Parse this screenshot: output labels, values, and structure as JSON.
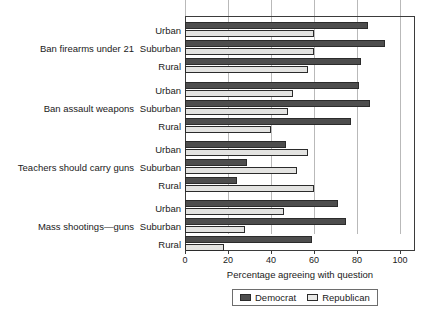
{
  "chart_data": {
    "type": "bar",
    "orientation": "horizontal",
    "title": "",
    "xlabel": "Percentage agreeing with question",
    "ylabel": "",
    "xlim": [
      0,
      107
    ],
    "xticks": [
      0,
      20,
      40,
      60,
      80,
      100
    ],
    "grid": "vertical",
    "legend_position": "bottom-center",
    "legend": [
      "Democrat",
      "Republican"
    ],
    "groups": [
      {
        "label": "Ban firearms under 21",
        "categories": [
          "Urban",
          "Suburban",
          "Rural"
        ],
        "series": [
          {
            "name": "Democrat",
            "values": [
              85,
              93,
              82
            ]
          },
          {
            "name": "Republican",
            "values": [
              60,
              60,
              57
            ]
          }
        ]
      },
      {
        "label": "Ban assault weapons",
        "categories": [
          "Urban",
          "Suburban",
          "Rural"
        ],
        "series": [
          {
            "name": "Democrat",
            "values": [
              81,
              86,
              77
            ]
          },
          {
            "name": "Republican",
            "values": [
              50,
              48,
              40
            ]
          }
        ]
      },
      {
        "label": "Teachers should carry guns",
        "categories": [
          "Urban",
          "Suburban",
          "Rural"
        ],
        "series": [
          {
            "name": "Democrat",
            "values": [
              47,
              29,
              24
            ]
          },
          {
            "name": "Republican",
            "values": [
              57,
              52,
              60
            ]
          }
        ]
      },
      {
        "label": "Mass shootings—guns",
        "categories": [
          "Urban",
          "Suburban",
          "Rural"
        ],
        "series": [
          {
            "name": "Democrat",
            "values": [
              71,
              75,
              59
            ]
          },
          {
            "name": "Republican",
            "values": [
              46,
              28,
              18
            ]
          }
        ]
      }
    ]
  },
  "axis": {
    "x_tick_labels": [
      "0",
      "20",
      "40",
      "60",
      "80",
      "100"
    ],
    "x_title": "Percentage agreeing with question"
  },
  "legend": {
    "democrat_label": "Democrat",
    "republican_label": "Republican"
  },
  "colors": {
    "democrat": "#4d4d4d",
    "republican": "#e3e3e1",
    "axis": "#3b3b3b",
    "grid": "#b9b9b9",
    "background": "#ffffff"
  }
}
